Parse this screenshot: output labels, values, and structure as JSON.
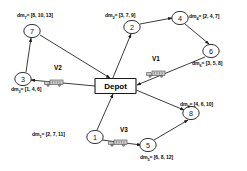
{
  "diagram": {
    "depot": {
      "label": "Depot"
    },
    "nodes": [
      {
        "id": "1",
        "label": "1",
        "cx": 95,
        "cy": 137
      },
      {
        "id": "2",
        "label": "2",
        "cx": 132,
        "cy": 27
      },
      {
        "id": "3",
        "label": "3",
        "cx": 23,
        "cy": 79
      },
      {
        "id": "4",
        "label": "4",
        "cx": 180,
        "cy": 18
      },
      {
        "id": "5",
        "label": "5",
        "cx": 148,
        "cy": 145
      },
      {
        "id": "6",
        "label": "6",
        "cx": 211,
        "cy": 51
      },
      {
        "id": "7",
        "label": "7",
        "cx": 32,
        "cy": 31
      },
      {
        "id": "8",
        "label": "8",
        "cx": 191,
        "cy": 113
      }
    ],
    "demands": [
      {
        "node": "7",
        "prefix": "dm",
        "sub": "7",
        "eq": "= ",
        "value": "[8, 10, 13]",
        "x": 17,
        "y": 12
      },
      {
        "node": "2",
        "prefix": "dm",
        "sub": "2",
        "eq": "= ",
        "value": "[3, 7, 9]",
        "x": 105,
        "y": 12
      },
      {
        "node": "4",
        "prefix": "dm",
        "sub": "4",
        "eq": "= ",
        "value": "[2, 4, 7]",
        "x": 189,
        "y": 13
      },
      {
        "node": "6",
        "prefix": "dm",
        "sub": "6",
        "eq": "= ",
        "value": "[3, 5, 8]",
        "x": 192,
        "y": 60
      },
      {
        "node": "3",
        "prefix": "dm",
        "sub": "3",
        "eq": "= ",
        "value": "[1, 4, 6]",
        "x": 11,
        "y": 86
      },
      {
        "node": "8",
        "prefix": "dm",
        "sub": "8",
        "eq": "= ",
        "value": "[4, 6, 10]",
        "x": 180,
        "y": 101
      },
      {
        "node": "1",
        "prefix": "dm",
        "sub": "1",
        "eq": "= ",
        "value": "[2, 7, 11]",
        "x": 32,
        "y": 131
      },
      {
        "node": "5",
        "prefix": "dm",
        "sub": "5",
        "eq": "= ",
        "value": "[6, 8, 12]",
        "x": 140,
        "y": 154
      }
    ],
    "vehicles": [
      {
        "id": "V1",
        "label": "V1",
        "label_x": 152,
        "label_y": 55,
        "truck_x": 146,
        "truck_y": 64
      },
      {
        "id": "V2",
        "label": "V2",
        "label_x": 54,
        "label_y": 64,
        "truck_x": 44,
        "truck_y": 73
      },
      {
        "id": "V3",
        "label": "V3",
        "label_x": 120,
        "label_y": 126,
        "truck_x": 108,
        "truck_y": 133
      }
    ],
    "edges": [
      {
        "from": "depot",
        "to": "2",
        "x1": 112,
        "y1": 80,
        "x2": 131,
        "y2": 34
      },
      {
        "from": "2",
        "to": "4",
        "x1": 140,
        "y1": 24,
        "x2": 172,
        "y2": 18
      },
      {
        "from": "4",
        "to": "6",
        "x1": 185,
        "y1": 24,
        "x2": 209,
        "y2": 44
      },
      {
        "from": "6",
        "to": "depot",
        "x1": 205,
        "y1": 57,
        "x2": 137,
        "y2": 85
      },
      {
        "from": "3",
        "to": "7",
        "x1": 26,
        "y1": 72,
        "x2": 31,
        "y2": 38
      },
      {
        "from": "7",
        "to": "depot",
        "x1": 40,
        "y1": 35,
        "x2": 110,
        "y2": 78
      },
      {
        "from": "depot",
        "to": "3",
        "x1": 95,
        "y1": 86,
        "x2": 31,
        "y2": 80
      },
      {
        "from": "depot",
        "to": "8",
        "x1": 136,
        "y1": 90,
        "x2": 184,
        "y2": 110
      },
      {
        "from": "5",
        "to": "8",
        "x1": 154,
        "y1": 140,
        "x2": 188,
        "y2": 120
      },
      {
        "from": "1",
        "to": "5",
        "x1": 102,
        "y1": 140,
        "x2": 141,
        "y2": 145
      },
      {
        "from": "1",
        "to": "depot",
        "x1": 97,
        "y1": 130,
        "x2": 113,
        "y2": 94
      }
    ],
    "colors": {
      "stroke": "#1a1a1a",
      "node_fill": "#ffffff",
      "truck_body": "#c9c9c9",
      "truck_outline": "#4a4a4a",
      "text": "#0b0b0b"
    }
  }
}
